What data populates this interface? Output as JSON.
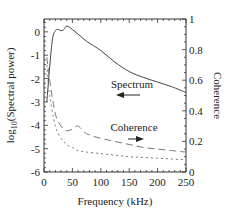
{
  "chart_data": {
    "type": "line",
    "title": "",
    "xlabel": "Frequency (kHz)",
    "ylabel_left": "log10(Spectral power)",
    "ylabel_left_parts": {
      "pre": "log",
      "sub": "10",
      "post": "(Spectral power)"
    },
    "ylabel_right": "Coherence",
    "xlim": [
      0,
      250
    ],
    "ylim_left": [
      -6,
      0.55
    ],
    "ylim_right": [
      0,
      1
    ],
    "x_ticks": [
      "0",
      "50",
      "100",
      "150",
      "200",
      "250"
    ],
    "y_left_ticks": [
      "0",
      "-1",
      "-2",
      "-3",
      "-4",
      "-5",
      "-6"
    ],
    "y_right_ticks": [
      "0",
      "0.2",
      "0.4",
      "0.6",
      "0.8",
      "1"
    ],
    "grid": false,
    "legend": null,
    "annotations": [
      {
        "text": "Spectrum",
        "arrow": "left",
        "axis": "left"
      },
      {
        "text": "Coherence",
        "arrow": "right",
        "axis": "right"
      }
    ],
    "series": [
      {
        "name": "Spectrum",
        "axis": "left",
        "style": "solid",
        "x": [
          5,
          10,
          15,
          20,
          25,
          30,
          35,
          40,
          50,
          60,
          75,
          100,
          125,
          150,
          175,
          200,
          225,
          250
        ],
        "values": [
          -3.0,
          -1.5,
          -0.3,
          0.05,
          0.1,
          0.05,
          0.1,
          0.25,
          0.1,
          -0.1,
          -0.4,
          -0.8,
          -1.3,
          -1.7,
          -1.95,
          -2.15,
          -2.35,
          -2.6
        ]
      },
      {
        "name": "Coherence (long dash)",
        "axis": "right",
        "style": "long-dash",
        "x": [
          5,
          10,
          20,
          30,
          40,
          50,
          60,
          75,
          100,
          125,
          150,
          175,
          200,
          225,
          250
        ],
        "values": [
          0.75,
          0.6,
          0.38,
          0.3,
          0.27,
          0.28,
          0.3,
          0.25,
          0.22,
          0.2,
          0.18,
          0.16,
          0.15,
          0.14,
          0.13
        ]
      },
      {
        "name": "Coherence (dotted)",
        "axis": "right",
        "style": "dotted",
        "x": [
          5,
          10,
          20,
          30,
          40,
          50,
          60,
          75,
          100,
          125,
          150,
          175,
          200,
          225,
          250
        ],
        "values": [
          0.7,
          0.5,
          0.3,
          0.22,
          0.18,
          0.16,
          0.14,
          0.13,
          0.12,
          0.11,
          0.1,
          0.095,
          0.09,
          0.085,
          0.08
        ]
      }
    ]
  }
}
